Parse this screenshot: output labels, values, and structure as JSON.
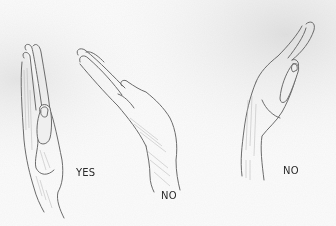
{
  "image": {
    "type": "pencil-sketch",
    "subject": "three hands held flat at different wrist angles",
    "background_color": "#fbfbfb",
    "stroke_color": "#6b6b6b",
    "shade_color": "#b8b8b8"
  },
  "figures": [
    {
      "id": "hand-left",
      "pose": "vertical straight wrist, palm facing side",
      "label": "YES"
    },
    {
      "id": "hand-middle",
      "pose": "wrist bent, fingers angled up-left",
      "label": "NO"
    },
    {
      "id": "hand-right",
      "pose": "wrist bent, fingers angled up-right",
      "label": "NO"
    }
  ],
  "labels": {
    "yes": "YES",
    "no_middle": "NO",
    "no_right": "NO"
  }
}
